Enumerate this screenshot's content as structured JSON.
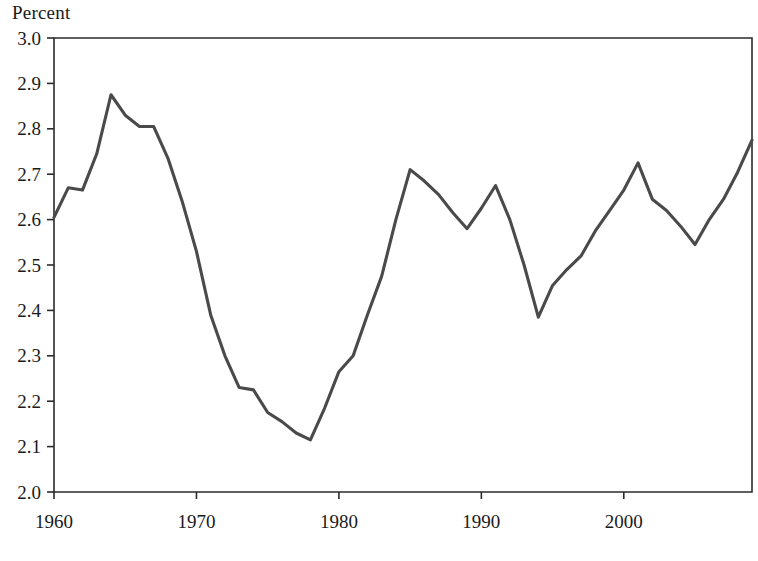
{
  "figure": {
    "axis_title": "Percent",
    "background_color": "#ffffff",
    "line_color": "#4a4a4a",
    "axis_color": "#2b2b2b"
  },
  "chart_data": {
    "type": "line",
    "title": "",
    "subtitle": "",
    "xlabel": "",
    "ylabel": "Percent",
    "ylim": [
      2.0,
      3.0
    ],
    "xlim": [
      1960,
      2009
    ],
    "grid": false,
    "legend": null,
    "y_ticks": [
      "2.0",
      "2.1",
      "2.2",
      "2.3",
      "2.4",
      "2.5",
      "2.6",
      "2.7",
      "2.8",
      "2.9",
      "3.0"
    ],
    "x_ticks": [
      "1960",
      "1970",
      "1980",
      "1990",
      "2000"
    ],
    "x_tick_values": [
      1960,
      1970,
      1980,
      1990,
      2000
    ],
    "series": [
      {
        "name": "Percent",
        "color": "#4a4a4a",
        "x": [
          1960,
          1961,
          1962,
          1963,
          1964,
          1965,
          1966,
          1967,
          1968,
          1969,
          1970,
          1971,
          1972,
          1973,
          1974,
          1975,
          1976,
          1977,
          1978,
          1979,
          1980,
          1981,
          1982,
          1983,
          1984,
          1985,
          1986,
          1987,
          1988,
          1989,
          1990,
          1991,
          1992,
          1993,
          1994,
          1995,
          1996,
          1997,
          1998,
          1999,
          2000,
          2001,
          2002,
          2003,
          2004,
          2005,
          2006,
          2007,
          2008,
          2009
        ],
        "values": [
          2.605,
          2.67,
          2.665,
          2.745,
          2.875,
          2.83,
          2.805,
          2.805,
          2.735,
          2.64,
          2.53,
          2.39,
          2.3,
          2.23,
          2.225,
          2.175,
          2.155,
          2.13,
          2.115,
          2.185,
          2.265,
          2.3,
          2.39,
          2.475,
          2.6,
          2.71,
          2.685,
          2.655,
          2.615,
          2.58,
          2.625,
          2.675,
          2.6,
          2.5,
          2.385,
          2.455,
          2.49,
          2.52,
          2.575,
          2.62,
          2.665,
          2.725,
          2.645,
          2.62,
          2.585,
          2.545,
          2.6,
          2.645,
          2.705,
          2.775
        ]
      }
    ]
  }
}
